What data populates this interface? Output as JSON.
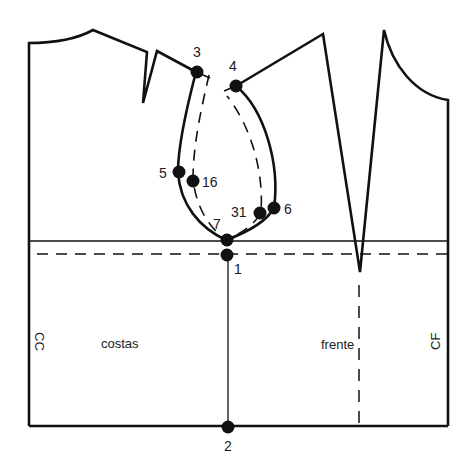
{
  "diagram": {
    "type": "sewing-pattern-bodice",
    "labels": {
      "back_piece": "costas",
      "front_piece": "frente",
      "center_back": "CC",
      "center_front": "CF"
    },
    "points": [
      {
        "id": "1",
        "label": "1"
      },
      {
        "id": "2",
        "label": "2"
      },
      {
        "id": "3",
        "label": "3"
      },
      {
        "id": "4",
        "label": "4"
      },
      {
        "id": "5",
        "label": "5"
      },
      {
        "id": "6",
        "label": "6"
      },
      {
        "id": "7",
        "label": "7"
      },
      {
        "id": "16",
        "label": "16"
      },
      {
        "id": "31",
        "label": "31"
      }
    ],
    "colors": {
      "line": "#111111",
      "background": "#ffffff"
    }
  }
}
